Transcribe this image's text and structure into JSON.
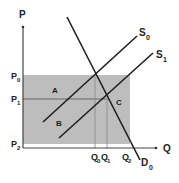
{
  "diagram": {
    "colors": {
      "shade": "#bdbdbd",
      "line": "#1f1f1f",
      "axis": "#444444",
      "guide": "#777777"
    },
    "axes": {
      "y_label": "P",
      "x_label": "Q"
    },
    "price_labels": {
      "p0": "P",
      "p0_sub": "0",
      "p1": "P",
      "p1_sub": "1",
      "p2": "P",
      "p2_sub": "2"
    },
    "quantity_labels": {
      "q0": "Q",
      "q0_sub": "0",
      "q1": "Q",
      "q1_sub": "1",
      "q2": "Q",
      "q2_sub": "2"
    },
    "curves": {
      "s0": "S",
      "s0_sub": "0",
      "s1": "S",
      "s1_sub": "1",
      "d0": "D",
      "d0_sub": "0"
    },
    "regions": {
      "a": "A",
      "b": "B",
      "c": "C"
    }
  }
}
